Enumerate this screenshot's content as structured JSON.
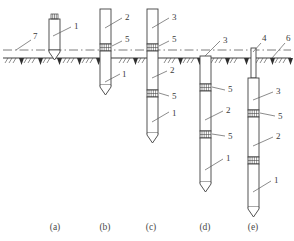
{
  "figure": {
    "type": "engineering-diagram",
    "background_color": "#ffffff",
    "line_color": "#404040",
    "text_color": "#3a3a3a"
  },
  "ground": {
    "surface_label": "6",
    "water_or_datum_label": "7",
    "surface_y": 58,
    "datum_y": 50
  },
  "callouts": {
    "n1": "1",
    "n2": "2",
    "n3": "3",
    "n4": "4",
    "n5": "5",
    "n6": "6",
    "n7": "7"
  },
  "panels": [
    {
      "caption": "(a)",
      "caption_x": 55,
      "labels": [
        {
          "text": "1",
          "x": 74,
          "y": 29
        }
      ]
    },
    {
      "caption": "(b)",
      "caption_x": 110,
      "labels": [
        {
          "text": "2",
          "x": 125,
          "y": 20
        },
        {
          "text": "5",
          "x": 125,
          "y": 42
        },
        {
          "text": "1",
          "x": 122,
          "y": 77
        }
      ]
    },
    {
      "caption": "(c)",
      "caption_x": 152,
      "labels": [
        {
          "text": "3",
          "x": 172,
          "y": 20
        },
        {
          "text": "5",
          "x": 172,
          "y": 42
        },
        {
          "text": "2",
          "x": 170,
          "y": 75
        },
        {
          "text": "5",
          "x": 172,
          "y": 98
        },
        {
          "text": "1",
          "x": 172,
          "y": 115
        }
      ]
    },
    {
      "caption": "(d)",
      "caption_x": 205,
      "labels": [
        {
          "text": "3",
          "x": 223,
          "y": 43
        },
        {
          "text": "5",
          "x": 228,
          "y": 92
        },
        {
          "text": "2",
          "x": 226,
          "y": 115
        },
        {
          "text": "5",
          "x": 228,
          "y": 138
        },
        {
          "text": "1",
          "x": 226,
          "y": 163
        }
      ]
    },
    {
      "caption": "(e)",
      "caption_x": 253,
      "labels": [
        {
          "text": "4",
          "x": 262,
          "y": 41
        },
        {
          "text": "6",
          "x": 286,
          "y": 41
        },
        {
          "text": "3",
          "x": 276,
          "y": 95
        },
        {
          "text": "5",
          "x": 278,
          "y": 118
        },
        {
          "text": "2",
          "x": 276,
          "y": 140
        },
        {
          "text": "1",
          "x": 274,
          "y": 185
        }
      ]
    }
  ],
  "captions": {
    "a": "(a)",
    "b": "(b)",
    "c": "(c)",
    "d": "(d)",
    "e": "(e)"
  }
}
